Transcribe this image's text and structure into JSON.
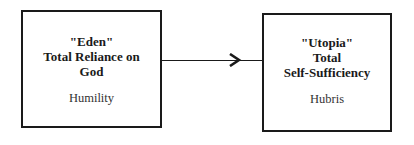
{
  "diagram": {
    "left_box": {
      "title_lines": [
        "\"Eden\"",
        "Total Reliance on",
        "God"
      ],
      "subtitle": "Humility"
    },
    "right_box": {
      "title_lines": [
        "\"Utopia\"",
        "Total",
        "Self-Sufficiency"
      ],
      "subtitle": "Hubris"
    },
    "connector": {
      "direction": "left-to-right",
      "icon": "arrow-right-icon"
    }
  }
}
